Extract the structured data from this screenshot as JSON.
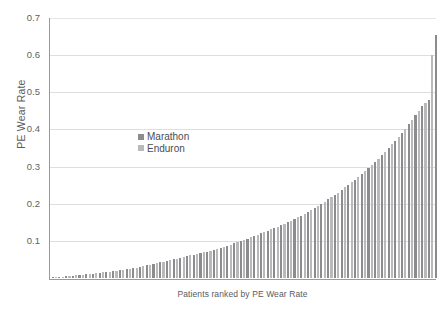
{
  "chart_data": {
    "type": "bar",
    "title": "",
    "xlabel": "Patients ranked by PE Wear Rate",
    "ylabel": "PE Wear Rate",
    "ylim": [
      0,
      0.7
    ],
    "ytick_labels": [
      "0.7",
      "0.6",
      "0.5",
      "0.4",
      "0.3",
      "0.2",
      "0.1"
    ],
    "ytick_values": [
      0.7,
      0.6,
      0.5,
      0.4,
      0.3,
      0.2,
      0.1
    ],
    "grid": true,
    "legend_position": "inside-upper-left",
    "series": [
      {
        "name": "Marathon",
        "color": "#8c8c8e"
      },
      {
        "name": "Enduron",
        "color": "#b9b9bb"
      }
    ],
    "categories_note": "Individual patients sorted ascending by PE wear rate",
    "bar_count": 115,
    "series_assignment": [
      "Marathon",
      "Enduron",
      "Marathon",
      "Enduron",
      "Marathon",
      "Enduron",
      "Marathon",
      "Enduron",
      "Marathon",
      "Enduron",
      "Marathon",
      "Enduron",
      "Marathon",
      "Enduron",
      "Marathon",
      "Enduron",
      "Marathon",
      "Enduron",
      "Marathon",
      "Enduron",
      "Marathon",
      "Enduron",
      "Marathon",
      "Enduron",
      "Marathon",
      "Enduron",
      "Marathon",
      "Enduron",
      "Marathon",
      "Enduron",
      "Marathon",
      "Enduron",
      "Marathon",
      "Enduron",
      "Marathon",
      "Enduron",
      "Marathon",
      "Enduron",
      "Marathon",
      "Enduron",
      "Marathon",
      "Enduron",
      "Marathon",
      "Enduron",
      "Marathon",
      "Enduron",
      "Marathon",
      "Enduron",
      "Marathon",
      "Enduron",
      "Marathon",
      "Enduron",
      "Marathon",
      "Enduron",
      "Marathon",
      "Enduron",
      "Marathon",
      "Enduron",
      "Marathon",
      "Enduron",
      "Marathon",
      "Enduron",
      "Marathon",
      "Enduron",
      "Marathon",
      "Enduron",
      "Marathon",
      "Enduron",
      "Marathon",
      "Enduron",
      "Marathon",
      "Enduron",
      "Marathon",
      "Enduron",
      "Marathon",
      "Enduron",
      "Marathon",
      "Enduron",
      "Marathon",
      "Enduron",
      "Marathon",
      "Enduron",
      "Marathon",
      "Enduron",
      "Marathon",
      "Enduron",
      "Marathon",
      "Enduron",
      "Marathon",
      "Enduron",
      "Marathon",
      "Enduron",
      "Marathon",
      "Enduron",
      "Marathon",
      "Enduron",
      "Marathon",
      "Enduron",
      "Marathon",
      "Enduron",
      "Marathon",
      "Enduron",
      "Marathon",
      "Enduron",
      "Marathon",
      "Enduron",
      "Marathon",
      "Enduron",
      "Marathon",
      "Enduron",
      "Marathon",
      "Enduron",
      "Marathon",
      "Enduron",
      "Marathon"
    ],
    "values": [
      0.002,
      0.003,
      0.004,
      0.004,
      0.005,
      0.006,
      0.006,
      0.007,
      0.008,
      0.009,
      0.01,
      0.011,
      0.012,
      0.013,
      0.014,
      0.015,
      0.016,
      0.017,
      0.018,
      0.02,
      0.021,
      0.022,
      0.024,
      0.025,
      0.027,
      0.028,
      0.03,
      0.032,
      0.034,
      0.036,
      0.038,
      0.04,
      0.042,
      0.044,
      0.046,
      0.048,
      0.05,
      0.052,
      0.055,
      0.057,
      0.059,
      0.061,
      0.063,
      0.065,
      0.067,
      0.069,
      0.071,
      0.073,
      0.076,
      0.078,
      0.081,
      0.084,
      0.087,
      0.09,
      0.094,
      0.098,
      0.1,
      0.103,
      0.106,
      0.11,
      0.113,
      0.117,
      0.12,
      0.124,
      0.127,
      0.131,
      0.134,
      0.138,
      0.142,
      0.146,
      0.15,
      0.154,
      0.158,
      0.163,
      0.168,
      0.173,
      0.178,
      0.183,
      0.188,
      0.194,
      0.2,
      0.206,
      0.212,
      0.218,
      0.224,
      0.23,
      0.237,
      0.244,
      0.251,
      0.258,
      0.265,
      0.272,
      0.28,
      0.288,
      0.296,
      0.304,
      0.312,
      0.321,
      0.33,
      0.34,
      0.35,
      0.36,
      0.37,
      0.38,
      0.391,
      0.402,
      0.414,
      0.426,
      0.438,
      0.45,
      0.462,
      0.47,
      0.478,
      0.6,
      0.655
    ]
  },
  "legend": {
    "items": [
      {
        "label": "Marathon"
      },
      {
        "label": "Enduron"
      }
    ]
  },
  "axes": {
    "y_title": "PE Wear Rate",
    "x_title": "Patients ranked by PE Wear Rate"
  }
}
